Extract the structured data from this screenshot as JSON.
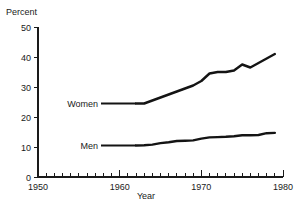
{
  "chart_data": {
    "type": "line",
    "title": "",
    "xlabel": "Year",
    "ylabel": "Percent",
    "xlim": [
      1950,
      1980
    ],
    "ylim": [
      0,
      50
    ],
    "grid": false,
    "legend_position": "inline-annotations",
    "x_ticks": [
      1950,
      1960,
      1970,
      1980
    ],
    "x_tick_labels": [
      "1950",
      "1960",
      "1970",
      "1980"
    ],
    "x_minor_tick_step": 1,
    "y_ticks": [
      0,
      10,
      20,
      30,
      40,
      50
    ],
    "y_tick_labels": [
      "0",
      "10",
      "20",
      "30",
      "40",
      "50"
    ],
    "series": [
      {
        "name": "Women",
        "x": [
          1962,
          1963,
          1964,
          1965,
          1966,
          1967,
          1968,
          1969,
          1970,
          1971,
          1972,
          1973,
          1974,
          1975,
          1976,
          1977,
          1978,
          1979
        ],
        "values": [
          24.5,
          24.5,
          25.5,
          26.5,
          27.5,
          28.5,
          29.5,
          30.5,
          32.0,
          34.5,
          35.0,
          35.0,
          35.5,
          37.5,
          36.5,
          38.0,
          39.5,
          41.0
        ]
      },
      {
        "name": "Men",
        "x": [
          1962,
          1963,
          1964,
          1965,
          1966,
          1967,
          1968,
          1969,
          1970,
          1971,
          1972,
          1973,
          1974,
          1975,
          1976,
          1977,
          1978,
          1979
        ],
        "values": [
          10.5,
          10.6,
          10.8,
          11.3,
          11.6,
          12.0,
          12.1,
          12.2,
          12.8,
          13.2,
          13.3,
          13.4,
          13.6,
          13.9,
          13.9,
          14.0,
          14.6,
          14.7
        ]
      }
    ],
    "annotations": [
      {
        "text": "Women",
        "series": "Women"
      },
      {
        "text": "Men",
        "series": "Men"
      }
    ],
    "colors": {
      "line": "#141414",
      "axis": "#1a1a1a",
      "background": "#ffffff"
    }
  }
}
